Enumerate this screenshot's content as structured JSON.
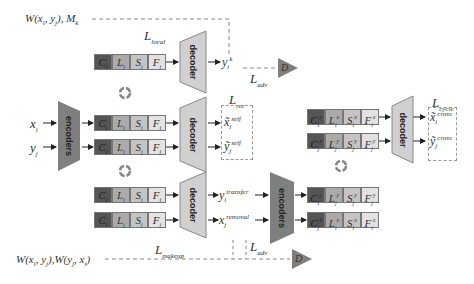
{
  "diagram": {
    "blocks": {
      "encoders_label": "encoders",
      "decoder_label": "decoder",
      "discriminator_label": "D"
    },
    "inputs": {
      "x": "x",
      "x_sub": "i",
      "y": "y",
      "y_sub": "j"
    },
    "top_left_label": {
      "text": "W(x",
      "full": "W(x_i, y_j), M_k"
    },
    "bottom_left_label": {
      "full": "W(x_i, y_j), W(y_j, x_i)"
    },
    "losses": {
      "local": "local",
      "adv": "adv",
      "rec": "rec",
      "cycle": "cycle",
      "makeup": "makeup"
    },
    "outputs": {
      "yk": "y_i^k",
      "x_self": "x̃_i^self",
      "y_self": "ỹ_j^self",
      "y_transfer": "y_i^transfer",
      "x_removal": "x_j^removal",
      "x_cross": "x̃_i^cross",
      "y_cross": "ỹ_j^cross"
    },
    "feature_rows": [
      {
        "id": "top",
        "cells": [
          "C_i",
          "L_i",
          "S_i",
          "F_i"
        ]
      },
      {
        "id": "x-features",
        "cells": [
          "C_i",
          "L_i",
          "S_i",
          "F_i"
        ]
      },
      {
        "id": "y-features",
        "cells": [
          "C_j",
          "L_j",
          "S_j",
          "F_j"
        ]
      },
      {
        "id": "transfer-features",
        "cells": [
          "C_j",
          "L_i",
          "S_i",
          "F_i"
        ]
      },
      {
        "id": "removal-features",
        "cells": [
          "C_i",
          "L_j",
          "S_j",
          "F_j"
        ]
      },
      {
        "id": "re-encoded-y",
        "cells": [
          "C_i^y",
          "L_j^y",
          "S_j^y",
          "F_j^y"
        ]
      },
      {
        "id": "re-encoded-x",
        "cells": [
          "C_j^x",
          "L_i^x",
          "S_i^x",
          "F_i^x"
        ]
      },
      {
        "id": "cross-x",
        "cells": [
          "C_i^y",
          "L_i^x",
          "S_i^x",
          "F_i^x"
        ]
      },
      {
        "id": "cross-y",
        "cells": [
          "C_j^x",
          "L_j^y",
          "S_j^y",
          "F_j^y"
        ]
      }
    ],
    "colors": {
      "content": "#555555",
      "lip": "#aaaaaa",
      "skin": "#c4c4c4",
      "face": "#e2e2e2",
      "block": "#7f7f7f",
      "block_light": "#d0d0d0"
    }
  }
}
